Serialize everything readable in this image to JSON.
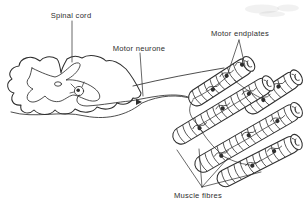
{
  "figure": {
    "background": "#ffffff",
    "ink": "#2e2e2e"
  },
  "labels": {
    "spinal_cord": "Spinal cord",
    "motor_neurone": "Motor neurone",
    "motor_endplates": "Motor endplates",
    "muscle_fibres": "Muscle fibres"
  }
}
